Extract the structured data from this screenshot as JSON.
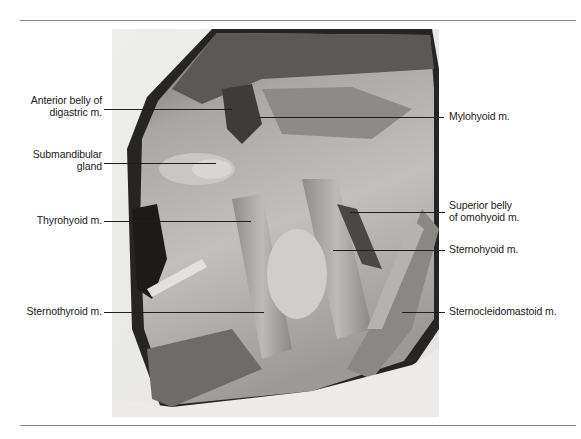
{
  "figure": {
    "colors": {
      "rule": "#8c8c8c",
      "leader": "#1e1e1e",
      "text": "#1a1a1a"
    },
    "labels_left": [
      {
        "id": "anterior-belly-digastric",
        "line1": "Anterior belly of",
        "line2": "digastric m."
      },
      {
        "id": "submandibular-gland",
        "line1": "Submandibular",
        "line2": "gland"
      },
      {
        "id": "thyrohyoid",
        "line1": "Thyrohyoid m.",
        "line2": ""
      },
      {
        "id": "sternothyroid",
        "line1": "Sternothyroid m.",
        "line2": ""
      }
    ],
    "labels_right": [
      {
        "id": "mylohyoid",
        "line1": "Mylohyoid m.",
        "line2": ""
      },
      {
        "id": "superior-belly-omohyoid",
        "line1": "Superior belly",
        "line2": "of omohyoid m."
      },
      {
        "id": "sternohyoid",
        "line1": "Sternohyoid m.",
        "line2": ""
      },
      {
        "id": "sternocleidomastoid",
        "line1": "Sternocleidomastoid m.",
        "line2": ""
      }
    ]
  }
}
